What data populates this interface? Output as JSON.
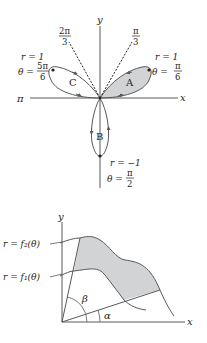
{
  "figure_top": {
    "title": "Three-leaved rose polar graph",
    "axis_labels": {
      "x": "x",
      "y": "y",
      "pi": "π"
    },
    "ray_labels": {
      "pi_over_3": {
        "num": "π",
        "den": "3"
      },
      "two_pi_over_3": {
        "num": "2π",
        "den": "3"
      }
    },
    "loops": [
      {
        "name": "A",
        "label": "A",
        "shaded": true,
        "tip_r": "r = 1",
        "tip_theta_prefix": "θ =",
        "tip_theta_num": "π",
        "tip_theta_den": "6"
      },
      {
        "name": "B",
        "label": "B",
        "shaded": false,
        "tip_r": "r = −1",
        "tip_theta_prefix": "θ =",
        "tip_theta_num": "π",
        "tip_theta_den": "2"
      },
      {
        "name": "C",
        "label": "C",
        "shaded": false,
        "tip_r": "r = 1",
        "tip_theta_prefix": "θ =",
        "tip_theta_num": "5π",
        "tip_theta_den": "6"
      }
    ],
    "colors": {
      "line": "#231f20",
      "curve": "#58595b",
      "shade": "#d1d3d4"
    }
  },
  "figure_bottom": {
    "title": "Region between two polar curves",
    "axis_labels": {
      "x": "x",
      "y": "y"
    },
    "curve_labels": {
      "outer": "r = f₂(θ)",
      "inner": "r = f₁(θ)"
    },
    "angle_labels": {
      "alpha": "α",
      "beta": "β"
    },
    "colors": {
      "line": "#231f20",
      "curve": "#58595b",
      "shade": "#d1d3d4"
    }
  }
}
